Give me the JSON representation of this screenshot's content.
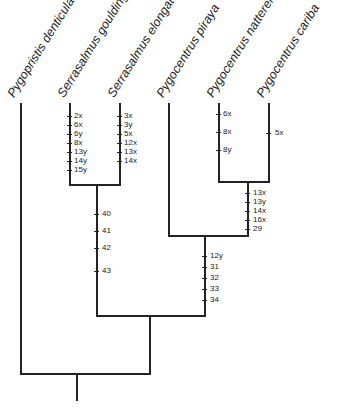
{
  "diagram": {
    "type": "cladogram",
    "taxa": [
      {
        "name": "Pygopristis denticulata",
        "x": 19
      },
      {
        "name": "Serrasalmus gouldingi",
        "x": 69
      },
      {
        "name": "Serrasalmus elongatus",
        "x": 119
      },
      {
        "name": "Pygocentrus piraya",
        "x": 168
      },
      {
        "name": "Pygocentrus nattereri",
        "x": 218
      },
      {
        "name": "Pygocentrus cariba",
        "x": 268
      }
    ],
    "branches": {
      "serrasalmus_gouldingi": {
        "characters": [
          "2x",
          "6x",
          "6y",
          "8x",
          "13y",
          "14y",
          "15y"
        ]
      },
      "serrasalmus_elongatus": {
        "characters": [
          "3x",
          "3y",
          "5x",
          "12x",
          "13x",
          "14x"
        ]
      },
      "pygocentrus_nattereri": {
        "characters": [
          "6x",
          "8x",
          "8y"
        ]
      },
      "pygocentrus_cariba": {
        "characters": [
          "5x"
        ]
      },
      "nattereri_cariba_clade": {
        "characters": [
          "13x",
          "13y",
          "14x",
          "16x",
          "29"
        ]
      },
      "serrasalmus_clade": {
        "characters": [
          "40",
          "41",
          "42",
          "43"
        ]
      },
      "pygocentrus_clade": {
        "characters": [
          "12y",
          "31",
          "32",
          "33",
          "34"
        ]
      }
    }
  }
}
